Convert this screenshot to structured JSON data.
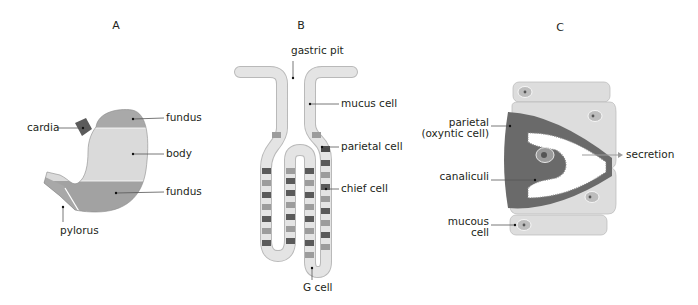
{
  "panels": {
    "a": {
      "title": "A",
      "labels": {
        "cardia": "cardia",
        "fundus_top": "fundus",
        "body": "body",
        "fundus_bottom": "fundus",
        "pylorus": "pylorus"
      }
    },
    "b": {
      "title": "B",
      "labels": {
        "gastric_pit": "gastric pit",
        "mucus_cell": "mucus cell",
        "parietal_cell": "parietal cell",
        "chief_cell": "chief cell",
        "g_cell": "G cell"
      }
    },
    "c": {
      "title": "C",
      "labels": {
        "parietal_line1": "parietal",
        "parietal_line2": "(oxyntic cell)",
        "canaliculi": "canaliculi",
        "mucous_line1": "mucous",
        "mucous_line2": "cell",
        "secretion": "secretion"
      }
    }
  },
  "colors": {
    "light_fill": "#dcdcdc",
    "mid_fill": "#a7a7a7",
    "dark_fill": "#6e6e6e",
    "cell_fill": "#e3e3e3",
    "cell_stroke": "#b5b5b5",
    "parietal_dark": "#555555",
    "chief_mid": "#9a9a9a",
    "arrow": "#9c9c9c"
  }
}
